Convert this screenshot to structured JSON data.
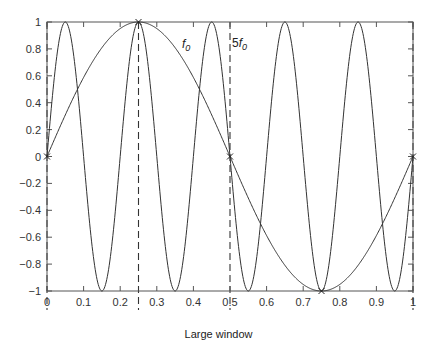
{
  "chart_data": {
    "type": "line",
    "title": "",
    "caption": "Large window",
    "xlabel": "",
    "ylabel": "",
    "xlim": [
      0,
      1
    ],
    "ylim": [
      -1,
      1
    ],
    "grid": false,
    "x_ticks": [
      "0",
      "0.1",
      "0.2",
      "0.3",
      "0.4",
      "0.5",
      "0.6",
      "0.7",
      "0.8",
      "0.9",
      "1"
    ],
    "y_ticks": [
      "1",
      "0.8",
      "0.6",
      "0.4",
      "0.2",
      "0",
      "-0.2",
      "-0.4",
      "-0.6",
      "-0.8",
      "-1"
    ],
    "series": [
      {
        "name": "f0",
        "label": "f",
        "subscript": "0",
        "function": "sin(2*pi*t)",
        "frequency": 1,
        "key_points": {
          "x": [
            0,
            0.25,
            0.5,
            0.75,
            1
          ],
          "y": [
            0,
            1,
            0,
            -1,
            0
          ]
        }
      },
      {
        "name": "5f0",
        "label": "5 f",
        "subscript": "0",
        "function": "sin(10*pi*t)",
        "frequency": 5,
        "key_points": {
          "x": [
            0,
            0.05,
            0.15,
            0.25,
            0.35,
            0.45,
            0.55,
            0.65,
            0.75,
            0.85,
            0.95,
            1
          ],
          "y": [
            0,
            1,
            -1,
            1,
            -1,
            1,
            -1,
            1,
            -1,
            1,
            -1,
            0
          ]
        }
      }
    ],
    "annotations": [
      {
        "text": "f0",
        "x": 0.33,
        "y": 0.88
      },
      {
        "text": "5f0",
        "x": 0.55,
        "y": 0.88
      }
    ],
    "sample_markers": {
      "x": [
        0,
        0.25,
        0.5,
        0.75,
        1
      ],
      "y": [
        0,
        1,
        0,
        -1,
        0
      ]
    },
    "dashed_verticals": [
      0,
      0.25,
      0.5,
      1
    ]
  }
}
